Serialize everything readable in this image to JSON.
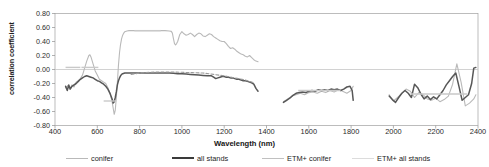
{
  "chart_data": {
    "type": "line",
    "title": "",
    "xlabel": "Wavelength (nm)",
    "ylabel": "correlation coefficient",
    "xlim": [
      400,
      2400
    ],
    "ylim": [
      -0.8,
      0.8
    ],
    "xticks": [
      400,
      600,
      800,
      1000,
      1200,
      1400,
      1600,
      1800,
      2000,
      2200,
      2400
    ],
    "yticks": [
      0.8,
      0.6,
      0.4,
      0.2,
      0.0,
      -0.2,
      -0.4,
      -0.6,
      -0.8
    ],
    "ytick_labels": [
      "0.80",
      "0.60",
      "0.40",
      "0.20",
      "0.00",
      "-0.20",
      "-0.40",
      "-0.60",
      "-0.80"
    ],
    "xtick_labels": [
      "400",
      "600",
      "800",
      "1000",
      "1200",
      "1400",
      "1600",
      "1800",
      "2000",
      "2200",
      "2400"
    ],
    "grid": "horizontal-zero-line",
    "legend_position": "below-axes",
    "colors": {
      "conifer": "#b9b9b9",
      "all_stands": "#575757",
      "etm_conifer": "#c9c9c9",
      "etm_all_stands": "#9a9a9a"
    },
    "series": [
      {
        "name": "conifer",
        "color": "#b9b9b9",
        "style": "solid",
        "segments": [
          {
            "x": [
              450,
              460,
              470,
              480,
              490,
              500,
              510,
              520,
              530,
              540,
              550,
              560,
              565,
              570,
              580,
              590,
              600,
              610,
              620,
              630,
              640,
              650,
              660,
              670,
              675,
              680,
              685,
              690,
              695,
              700,
              705,
              710,
              715,
              720,
              725,
              730,
              740,
              750,
              760,
              780,
              800,
              830,
              860,
              890,
              920,
              940,
              950,
              955,
              960,
              965,
              970,
              975,
              980,
              990,
              1000,
              1010,
              1020,
              1030,
              1040,
              1050,
              1060,
              1070,
              1080,
              1090,
              1100,
              1110,
              1120,
              1130,
              1140,
              1150,
              1160,
              1170,
              1180,
              1190,
              1200,
              1210,
              1220,
              1230,
              1240,
              1250,
              1260,
              1270,
              1280,
              1290,
              1300,
              1310,
              1320,
              1330,
              1340,
              1350,
              1360
            ],
            "y": [
              -0.26,
              -0.23,
              -0.28,
              -0.22,
              -0.25,
              -0.18,
              -0.16,
              -0.13,
              -0.08,
              0.02,
              0.12,
              0.2,
              0.21,
              0.18,
              0.08,
              -0.02,
              -0.08,
              -0.14,
              -0.16,
              -0.18,
              -0.2,
              -0.26,
              -0.34,
              -0.46,
              -0.55,
              -0.64,
              -0.58,
              -0.4,
              -0.18,
              0.06,
              0.24,
              0.36,
              0.44,
              0.49,
              0.52,
              0.54,
              0.55,
              0.555,
              0.555,
              0.555,
              0.555,
              0.555,
              0.555,
              0.555,
              0.555,
              0.55,
              0.545,
              0.52,
              0.44,
              0.37,
              0.35,
              0.37,
              0.4,
              0.5,
              0.54,
              0.51,
              0.49,
              0.5,
              0.52,
              0.5,
              0.47,
              0.5,
              0.52,
              0.51,
              0.48,
              0.47,
              0.49,
              0.51,
              0.5,
              0.47,
              0.45,
              0.43,
              0.41,
              0.4,
              0.4,
              0.37,
              0.33,
              0.3,
              0.31,
              0.29,
              0.26,
              0.24,
              0.22,
              0.21,
              0.19,
              0.18,
              0.2,
              0.17,
              0.14,
              0.12,
              0.11,
              0.1
            ]
          },
          {
            "x": [
              1480,
              1500,
              1520,
              1540,
              1560,
              1580,
              1600,
              1620,
              1640,
              1660,
              1680,
              1700,
              1720,
              1740,
              1760,
              1780,
              1800,
              1810
            ],
            "y": [
              -0.46,
              -0.42,
              -0.38,
              -0.36,
              -0.34,
              -0.36,
              -0.33,
              -0.32,
              -0.34,
              -0.31,
              -0.33,
              -0.3,
              -0.32,
              -0.29,
              -0.31,
              -0.34,
              -0.3,
              -0.24
            ]
          },
          {
            "x": [
              1980,
              2000,
              2020,
              2040,
              2060,
              2080,
              2100,
              2120,
              2140,
              2160,
              2180,
              2200,
              2220,
              2240,
              2260,
              2280,
              2300,
              2320,
              2340,
              2360,
              2380,
              2390
            ],
            "y": [
              -0.36,
              -0.45,
              -0.4,
              -0.34,
              -0.28,
              -0.31,
              -0.4,
              -0.33,
              -0.36,
              -0.42,
              -0.44,
              -0.41,
              -0.46,
              -0.43,
              -0.38,
              -0.21,
              0.08,
              -0.18,
              -0.52,
              -0.48,
              -0.42,
              -0.36
            ]
          }
        ]
      },
      {
        "name": "all stands",
        "color": "#575757",
        "style": "solid",
        "segments": [
          {
            "x": [
              450,
              458,
              465,
              472,
              480,
              490,
              500,
              510,
              520,
              530,
              540,
              550,
              560,
              570,
              580,
              590,
              600,
              610,
              620,
              630,
              640,
              650,
              660,
              670,
              675,
              680,
              685,
              690,
              695,
              700,
              705,
              710,
              715,
              720,
              730,
              740,
              760,
              780,
              800,
              830,
              860,
              900,
              940,
              960,
              980,
              1000,
              1020,
              1040,
              1060,
              1080,
              1100,
              1120,
              1140,
              1150,
              1160,
              1170,
              1180,
              1190,
              1200,
              1210,
              1220,
              1230,
              1240,
              1250,
              1260,
              1270,
              1280,
              1290,
              1300,
              1310,
              1320,
              1330,
              1340,
              1350,
              1360
            ],
            "y": [
              -0.24,
              -0.3,
              -0.22,
              -0.28,
              -0.24,
              -0.22,
              -0.2,
              -0.17,
              -0.14,
              -0.12,
              -0.1,
              -0.09,
              -0.1,
              -0.11,
              -0.12,
              -0.14,
              -0.16,
              -0.17,
              -0.19,
              -0.21,
              -0.24,
              -0.28,
              -0.34,
              -0.42,
              -0.48,
              -0.46,
              -0.4,
              -0.32,
              -0.22,
              -0.16,
              -0.12,
              -0.09,
              -0.07,
              -0.06,
              -0.05,
              -0.05,
              -0.05,
              -0.05,
              -0.05,
              -0.05,
              -0.05,
              -0.05,
              -0.05,
              -0.055,
              -0.06,
              -0.06,
              -0.065,
              -0.07,
              -0.075,
              -0.08,
              -0.085,
              -0.09,
              -0.09,
              -0.11,
              -0.13,
              -0.12,
              -0.11,
              -0.1,
              -0.1,
              -0.11,
              -0.11,
              -0.12,
              -0.12,
              -0.13,
              -0.14,
              -0.14,
              -0.15,
              -0.16,
              -0.16,
              -0.17,
              -0.18,
              -0.19,
              -0.21,
              -0.27,
              -0.31
            ]
          },
          {
            "x": [
              1480,
              1495,
              1510,
              1525,
              1540,
              1555,
              1570,
              1585,
              1600,
              1615,
              1630,
              1645,
              1660,
              1675,
              1690,
              1705,
              1720,
              1735,
              1750,
              1765,
              1780,
              1795,
              1805,
              1810
            ],
            "y": [
              -0.47,
              -0.44,
              -0.41,
              -0.37,
              -0.34,
              -0.33,
              -0.32,
              -0.33,
              -0.31,
              -0.3,
              -0.31,
              -0.29,
              -0.3,
              -0.29,
              -0.3,
              -0.28,
              -0.29,
              -0.28,
              -0.3,
              -0.28,
              -0.25,
              -0.24,
              -0.3,
              -0.44
            ]
          },
          {
            "x": [
              1980,
              1995,
              2010,
              2025,
              2040,
              2055,
              2070,
              2085,
              2100,
              2115,
              2130,
              2145,
              2160,
              2175,
              2190,
              2205,
              2220,
              2235,
              2250,
              2265,
              2280,
              2295,
              2310,
              2325,
              2340,
              2355,
              2370,
              2380,
              2390
            ],
            "y": [
              -0.38,
              -0.43,
              -0.47,
              -0.4,
              -0.34,
              -0.3,
              -0.34,
              -0.4,
              -0.21,
              -0.26,
              -0.35,
              -0.42,
              -0.38,
              -0.43,
              -0.39,
              -0.42,
              -0.36,
              -0.3,
              -0.22,
              -0.16,
              -0.1,
              -0.05,
              -0.24,
              -0.44,
              -0.4,
              -0.36,
              -0.2,
              0.02,
              0.03
            ]
          }
        ]
      },
      {
        "name": "ETM+ conifer",
        "color": "#c9c9c9",
        "style": "band-marks",
        "bands": [
          {
            "x0": 450,
            "x1": 520,
            "y": 0.03
          },
          {
            "x0": 525,
            "x1": 605,
            "y": 0.03
          },
          {
            "x0": 630,
            "x1": 690,
            "y": -0.45
          },
          {
            "x0": 775,
            "x1": 900,
            "y": 0.555
          },
          {
            "x0": 1550,
            "x1": 1750,
            "y": -0.3
          },
          {
            "x0": 2080,
            "x1": 2350,
            "y": -0.35
          }
        ]
      },
      {
        "name": "ETM+ all stands",
        "color": "#9a9a9a",
        "style": "dashed-overlay",
        "segments": [
          {
            "x": [
              760,
              800,
              850,
              900,
              950,
              1000,
              1050,
              1100,
              1150,
              1200,
              1250,
              1300,
              1340
            ],
            "y": [
              -0.07,
              -0.05,
              -0.04,
              -0.035,
              -0.035,
              -0.04,
              -0.045,
              -0.05,
              -0.07,
              -0.09,
              -0.12,
              -0.15,
              -0.19
            ]
          }
        ]
      }
    ]
  },
  "axis": {
    "ylabel": "correlation coefficient",
    "xlabel": "Wavelength (nm)"
  },
  "legend": {
    "items": [
      {
        "label": "conifer",
        "color": "#b9b9b9",
        "weight": "1.2px"
      },
      {
        "label": "all stands",
        "color": "#3a3a3a",
        "weight": "2.2px"
      },
      {
        "label": "ETM+ conifer",
        "color": "#c0c0c0",
        "weight": "1.2px"
      },
      {
        "label": "ETM+ all stands",
        "color": "#dcdcdc",
        "weight": "1.2px"
      }
    ]
  }
}
